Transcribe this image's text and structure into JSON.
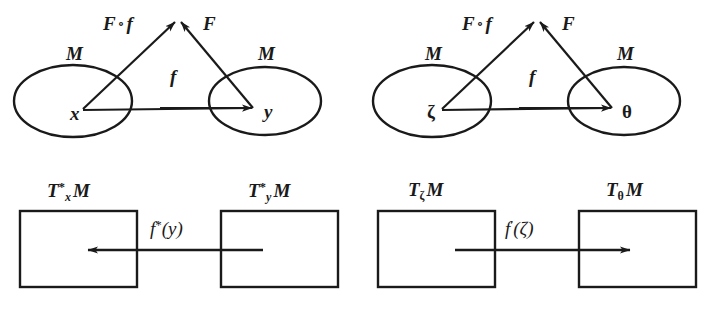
{
  "figure": {
    "ink_color": "#1a1a1a",
    "background_color": "#ffffff"
  },
  "panels": {
    "top_left": {
      "name": "manifold-diagram-xy",
      "source_set_label": "M",
      "target_set_label": "M",
      "source_point": "x",
      "target_point": "y",
      "map_direct": "f",
      "map_composed": "F",
      "map_composition_left": "F",
      "map_composition_ring": "∘",
      "map_composition_right": "f"
    },
    "top_right": {
      "name": "manifold-diagram-zeta-theta",
      "source_set_label": "M",
      "target_set_label": "M",
      "source_point": "ζ",
      "target_point": "θ",
      "map_direct": "f",
      "map_composed": "F",
      "map_composition_left": "F",
      "map_composition_ring": "∘",
      "map_composition_right": "f"
    },
    "bottom_left": {
      "name": "cotangent-space-diagram",
      "left_space": {
        "symbol": "T",
        "superscript": "*",
        "subscript": "x",
        "manifold": "M"
      },
      "right_space": {
        "symbol": "T",
        "superscript": "*",
        "subscript": "y",
        "manifold": "M"
      },
      "arrow_label": {
        "symbol": "f",
        "superscript": "*",
        "argument": "(y)"
      },
      "arrow_direction": "left"
    },
    "bottom_right": {
      "name": "tangent-space-diagram",
      "left_space": {
        "symbol": "T",
        "superscript": "",
        "subscript": "ζ",
        "manifold": "M"
      },
      "right_space": {
        "symbol": "T",
        "superscript": "",
        "subscript": "θ",
        "manifold": "M"
      },
      "arrow_label": {
        "symbol": "f",
        "superscript": "′",
        "argument": "(ζ)"
      },
      "arrow_direction": "right"
    }
  }
}
